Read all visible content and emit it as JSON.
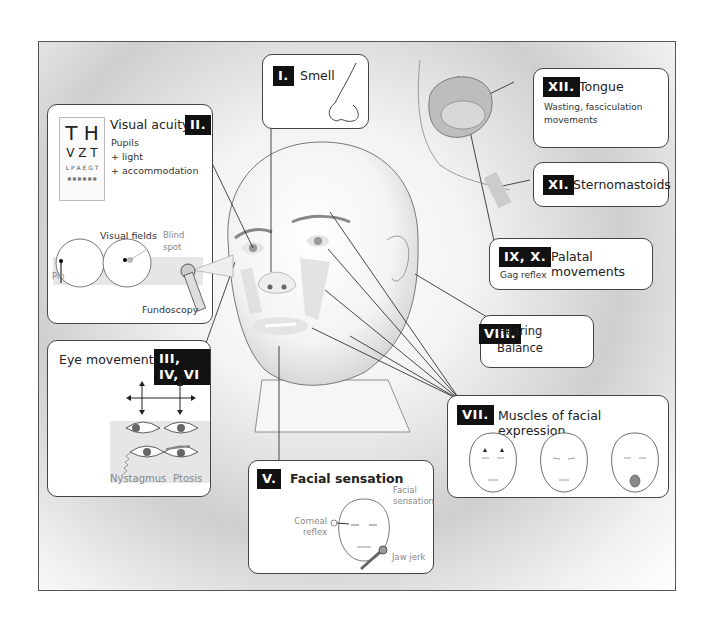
{
  "boxes": {
    "smell": {
      "numeral": "I.",
      "title": "Smell"
    },
    "vision": {
      "numeral": "II.",
      "title": "Visual acuity",
      "lines": [
        "Pupils",
        "+ light",
        "+ accommodation"
      ],
      "chart_rows": [
        "T H",
        "V Z T",
        "L P A E G T",
        "■ ■ ■ ■ ■ ■"
      ],
      "fields_label": "Visual fields",
      "blind_spot_label": "Blind spot",
      "pin_label": "Pin",
      "fundoscopy_label": "Fundoscopy"
    },
    "eye_movements": {
      "numeral": "III, IV, VI",
      "title": "Eye movements",
      "nystagmus_label": "Nystagmus",
      "ptosis_label": "Ptosis"
    },
    "facial_sensation": {
      "numeral": "V.",
      "title": "Facial sensation",
      "facial_sensation_label": "Facial sensation",
      "corneal_label": "Corneal reflex",
      "jaw_label": "Jaw jerk"
    },
    "facial_expression": {
      "numeral": "VII.",
      "title": "Muscles of facial expression"
    },
    "hearing": {
      "numeral": "VIII.",
      "lines": [
        "Hearing",
        "Balance"
      ]
    },
    "palatal": {
      "numeral": "IX, X.",
      "title": "Palatal movements",
      "sub": "Gag reflex"
    },
    "sternomastoids": {
      "numeral": "XI.",
      "title": "Sternomastoids"
    },
    "tongue": {
      "numeral": "XII.",
      "title": "Tongue",
      "lines": [
        "Wasting, fasciculation",
        "movements"
      ]
    }
  },
  "colors": {
    "frame": "#555555",
    "label_bg": "#111111",
    "label_fg": "#ffffff",
    "shade": "#cfcfcf"
  }
}
